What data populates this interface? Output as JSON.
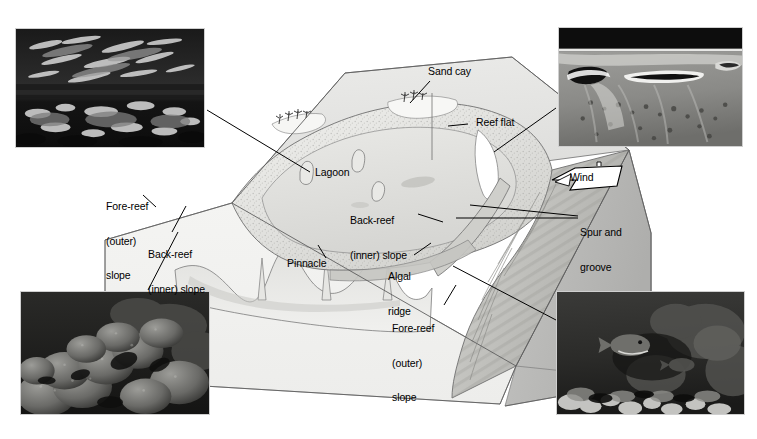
{
  "figure": {
    "background_color": "#ffffff",
    "width": 757,
    "height": 439
  },
  "diagram": {
    "type": "block-diagram",
    "block_face_colors": {
      "top_water": "#e3e3e1",
      "front_cut": "#f2f2f0",
      "right_cut": "#b9b9b7",
      "reef_body": "#dcdcda",
      "outline": "#5a5a5a"
    },
    "features": [
      {
        "name": "sand-cay",
        "label": "Sand cay"
      },
      {
        "name": "reef-flat",
        "label": "Reef flat"
      },
      {
        "name": "lagoon",
        "label": "Lagoon"
      },
      {
        "name": "pinnacle",
        "label": "Pinnacle"
      },
      {
        "name": "algal-ridge",
        "label": "Algal\nridge"
      },
      {
        "name": "spur-and-groove",
        "label": "Spur and\ngroove"
      },
      {
        "name": "wind",
        "label": "Wind"
      }
    ]
  },
  "labels": {
    "sand_cay": "Sand cay",
    "reef_flat": "Reef flat",
    "lagoon": "Lagoon",
    "pinnacle": "Pinnacle",
    "algal_ridge_line1": "Algal",
    "algal_ridge_line2": "ridge",
    "spur_groove_line1": "Spur and",
    "spur_groove_line2": "groove",
    "wind": "Wind",
    "fore_reef_left_line1": "Fore-reef",
    "fore_reef_left_line2": "(outer)",
    "fore_reef_left_line3": "slope",
    "fore_reef_right_line1": "Fore-reef",
    "fore_reef_right_line2": "(outer)",
    "fore_reef_right_line3": "slope",
    "back_reef_left_line1": "Back-reef",
    "back_reef_left_line2": "(inner) slope",
    "back_reef_mid_line1": "Back-reef",
    "back_reef_mid_line2": "(inner) slope"
  },
  "photos": {
    "top_left": {
      "name": "fore-reef-underwater-photo",
      "caption_semantic": "underwater view of reef crest with water surface above",
      "tone": "dark",
      "x": 15,
      "y": 28,
      "w": 190,
      "h": 120
    },
    "top_right": {
      "name": "aerial-reef-photo",
      "caption_semantic": "aerial oblique view of reef flat, lagoon and sand cays",
      "tone": "mid",
      "x": 558,
      "y": 27,
      "w": 185,
      "h": 120
    },
    "bottom_left": {
      "name": "massive-coral-heads-photo",
      "caption_semantic": "massive coral heads on back-reef inner slope",
      "tone": "dark",
      "x": 20,
      "y": 291,
      "w": 190,
      "h": 124
    },
    "bottom_right": {
      "name": "fore-reef-fish-photo",
      "caption_semantic": "fore-reef slope with fish and coral",
      "tone": "dark",
      "x": 556,
      "y": 291,
      "w": 189,
      "h": 124
    }
  }
}
